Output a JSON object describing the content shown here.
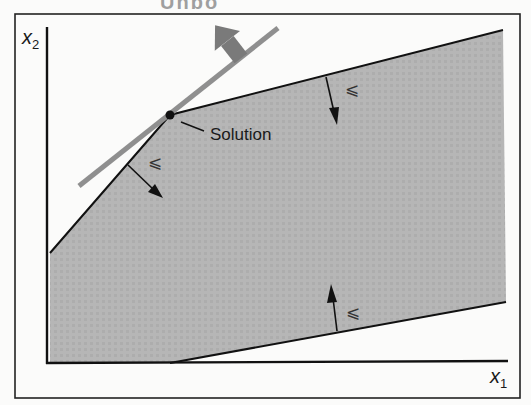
{
  "diagram": {
    "title_fragment": "Unbo",
    "x_axis_label": "x",
    "x_axis_sub": "1",
    "y_axis_label": "x",
    "y_axis_sub": "2",
    "solution_label": "Solution",
    "constraint_symbol": "⩽",
    "feasible_region_color": "#b4b4b4",
    "objective_line_color": "#8f8f8f",
    "objective_arrow_color": "#7a7a7a",
    "feasible_region_vertices": [
      [
        50,
        253
      ],
      [
        170,
        115
      ],
      [
        503,
        30
      ],
      [
        506,
        302
      ],
      [
        168,
        363
      ],
      [
        50,
        363
      ]
    ],
    "solution_point": [
      170,
      115
    ],
    "constraints": [
      {
        "name": "upper-left",
        "symbol": "⩽",
        "normal_direction": "down-right"
      },
      {
        "name": "upper-right",
        "symbol": "⩽",
        "normal_direction": "down"
      },
      {
        "name": "lower",
        "symbol": "⩽",
        "normal_direction": "up"
      }
    ]
  }
}
